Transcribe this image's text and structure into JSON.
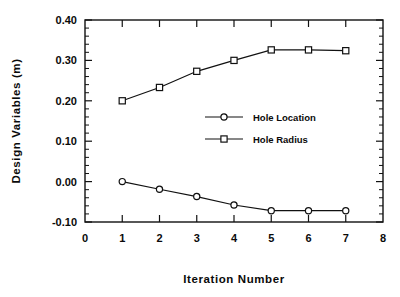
{
  "chart_data": {
    "type": "line",
    "title": "",
    "xlabel": "Iteration  Number",
    "ylabel": "Design  Variables  (m)",
    "xlim": [
      0,
      8
    ],
    "ylim": [
      -0.1,
      0.4
    ],
    "x": [
      1,
      2,
      3,
      4,
      5,
      6,
      7
    ],
    "xticks": [
      0,
      1,
      2,
      3,
      4,
      5,
      6,
      7,
      8
    ],
    "xtick_labels": [
      "0",
      "1",
      "2",
      "3",
      "4",
      "5",
      "6",
      "7",
      "8"
    ],
    "yticks": [
      -0.1,
      0.0,
      0.1,
      0.2,
      0.3,
      0.4
    ],
    "ytick_labels": [
      "-0.10",
      "0.00",
      "0.10",
      "0.20",
      "0.30",
      "0.40"
    ],
    "y_minor_interval": 0.02,
    "grid": false,
    "legend_position": "center-right",
    "series": [
      {
        "name": "Hole Location",
        "marker": "circle",
        "values": [
          0.0,
          -0.019,
          -0.037,
          -0.058,
          -0.072,
          -0.072,
          -0.072
        ]
      },
      {
        "name": "Hole Radius",
        "marker": "square",
        "values": [
          0.2,
          0.233,
          0.273,
          0.3,
          0.326,
          0.326,
          0.324
        ]
      }
    ]
  },
  "legend": {
    "entries": [
      {
        "label": "Hole Location"
      },
      {
        "label": "Hole Radius"
      }
    ]
  },
  "axes": {
    "y_title": "Design  Variables  (m)",
    "x_title": "Iteration  Number"
  }
}
